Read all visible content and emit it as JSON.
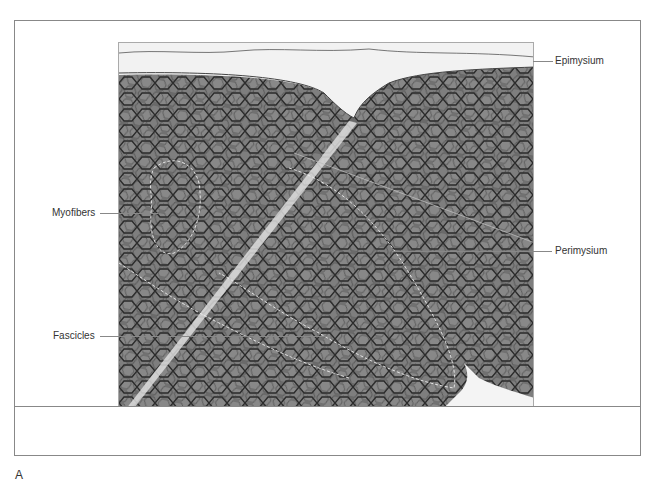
{
  "figure": {
    "panel_letter": "A",
    "labels": {
      "epimysium": "Epimysium",
      "perimysium": "Perimysium",
      "myofibers": "Myofibers",
      "fascicles": "Fascicles"
    }
  },
  "colors": {
    "border": "#888888",
    "tissue": "#7a7a7a",
    "membrane": "#2a2a2a",
    "connective": "#f2f2f2"
  }
}
